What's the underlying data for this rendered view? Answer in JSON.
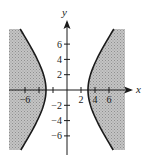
{
  "chart_data": {
    "type": "area",
    "title": "",
    "xlabel": "x",
    "ylabel": "y",
    "xlim": [
      -8.3,
      8.3
    ],
    "ylim": [
      -7.9,
      8
    ],
    "grid": false,
    "equation": "x^2/9 - y^2/16 >= 1",
    "boundary": "solid",
    "shaded_region": "outside branches (|x| beyond hyperbola)",
    "x_ticks": [
      -6,
      -4,
      -2,
      2,
      4,
      6
    ],
    "x_tick_labels": [
      "-6",
      "2",
      "4",
      "6"
    ],
    "y_ticks": [
      6,
      4,
      2,
      -2,
      -4,
      -6
    ],
    "y_tick_labels": [
      "6",
      "4",
      "2",
      "-2",
      "-4",
      "-6"
    ],
    "vertices": [
      [
        -3,
        0
      ],
      [
        3,
        0
      ]
    ],
    "series": [
      {
        "name": "right branch",
        "x": [
          6.7,
          5.0,
          4.0,
          3.35,
          3.0,
          3.35,
          4.0,
          5.0,
          6.7
        ],
        "y": [
          8,
          5.33,
          3.53,
          2,
          0,
          -2,
          -3.53,
          -5.33,
          -8
        ]
      },
      {
        "name": "left branch",
        "x": [
          -6.7,
          -5.0,
          -4.0,
          -3.35,
          -3.0,
          -3.35,
          -4.0,
          -5.0,
          -6.7
        ],
        "y": [
          8,
          5.33,
          3.53,
          2,
          0,
          -2,
          -3.53,
          -5.33,
          -8
        ]
      }
    ],
    "colors": {
      "shade": "#b5b5b5",
      "curve": "#1a1a1a",
      "axis": "#1a1a1a"
    }
  }
}
